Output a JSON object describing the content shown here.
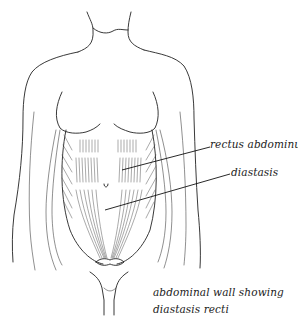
{
  "figure": {
    "title": "abdominal wall showing diastasis recti",
    "caption": {
      "line1": "abdominal wall showing",
      "line2": "diastasis recti"
    },
    "labels": [
      {
        "id": "rectus",
        "text": "rectus abdominus"
      },
      {
        "id": "diastasis",
        "text": "diastasis"
      }
    ],
    "colors": {
      "background": "#ffffff",
      "ink": "#222222"
    }
  }
}
